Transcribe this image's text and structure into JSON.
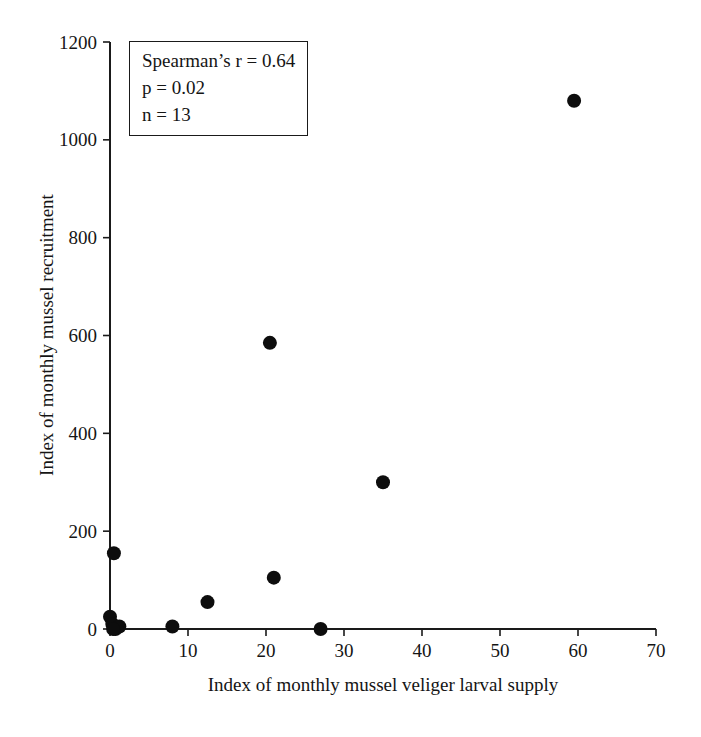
{
  "chart_data": {
    "type": "scatter",
    "title": "",
    "xlabel": "Index of monthly mussel veliger larval supply",
    "ylabel": "Index of monthly mussel recruitment",
    "xlim": [
      0,
      70
    ],
    "ylim": [
      0,
      1200
    ],
    "xticks": [
      0,
      10,
      20,
      30,
      40,
      50,
      60,
      70
    ],
    "yticks": [
      0,
      200,
      400,
      600,
      800,
      1000,
      1200
    ],
    "grid": false,
    "legend": "none",
    "marker": {
      "shape": "circle",
      "color": "#0d0d0d",
      "radius_px": 7
    },
    "axis_color": "#1a1a1a",
    "background_color": "#ffffff",
    "stats": {
      "spearman_r": 0.64,
      "p": 0.02,
      "n": 13
    },
    "annotation": {
      "lines": [
        "Spearman’s r = 0.64",
        "p = 0.02",
        "n = 13"
      ]
    },
    "points": [
      {
        "x": 0,
        "y": 25
      },
      {
        "x": 0.3,
        "y": 10
      },
      {
        "x": 0.7,
        "y": 0
      },
      {
        "x": 1.2,
        "y": 5
      },
      {
        "x": 0.4,
        "y": 0
      },
      {
        "x": 0.5,
        "y": 155
      },
      {
        "x": 8,
        "y": 5
      },
      {
        "x": 12.5,
        "y": 55
      },
      {
        "x": 20.5,
        "y": 585
      },
      {
        "x": 21,
        "y": 105
      },
      {
        "x": 27,
        "y": 0
      },
      {
        "x": 35,
        "y": 300
      },
      {
        "x": 59.5,
        "y": 1080
      }
    ]
  }
}
